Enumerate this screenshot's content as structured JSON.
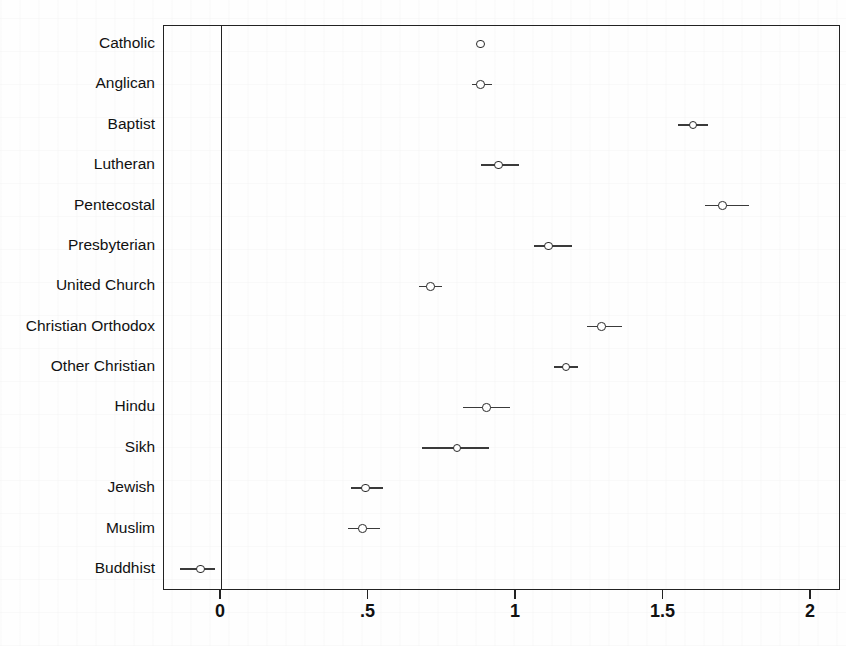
{
  "figure": {
    "kind": "coefficient-plot",
    "background_color": "#fefefe",
    "marker_color": "#2a2a2a",
    "line_color": "#3a3a3a"
  },
  "chart_data": {
    "type": "scatter",
    "title": "",
    "subtitle": "",
    "xlabel": "",
    "ylabel": "",
    "xlim": [
      -0.19,
      2.1
    ],
    "ylim": [
      0,
      14
    ],
    "grid": false,
    "legend": null,
    "reference_line": 0,
    "xticks": [
      0,
      0.5,
      1,
      1.5,
      2
    ],
    "xticklabels": [
      "0",
      ".5",
      "1",
      "1.5",
      "2"
    ],
    "categories": [
      "Catholic",
      "Anglican",
      "Baptist",
      "Lutheran",
      "Pentecostal",
      "Presbyterian",
      "United Church",
      "Christian Orthodox",
      "Other Christian",
      "Hindu",
      "Sikh",
      "Jewish",
      "Muslim",
      "Buddhist"
    ],
    "values": [
      0.88,
      0.88,
      1.6,
      0.94,
      1.7,
      1.11,
      0.71,
      1.29,
      1.17,
      0.9,
      0.8,
      0.49,
      0.48,
      -0.07
    ],
    "ci_low": [
      null,
      0.85,
      1.55,
      0.88,
      1.64,
      1.06,
      0.67,
      1.24,
      1.13,
      0.82,
      0.68,
      0.44,
      0.43,
      -0.14
    ],
    "ci_high": [
      null,
      0.92,
      1.65,
      1.01,
      1.79,
      1.19,
      0.75,
      1.36,
      1.21,
      0.98,
      0.91,
      0.55,
      0.54,
      -0.02
    ],
    "points": [
      {
        "label": "Catholic",
        "value": 0.88,
        "ci_low": null,
        "ci_high": null
      },
      {
        "label": "Anglican",
        "value": 0.88,
        "ci_low": 0.85,
        "ci_high": 0.92
      },
      {
        "label": "Baptist",
        "value": 1.6,
        "ci_low": 1.55,
        "ci_high": 1.65
      },
      {
        "label": "Lutheran",
        "value": 0.94,
        "ci_low": 0.88,
        "ci_high": 1.01
      },
      {
        "label": "Pentecostal",
        "value": 1.7,
        "ci_low": 1.64,
        "ci_high": 1.79
      },
      {
        "label": "Presbyterian",
        "value": 1.11,
        "ci_low": 1.06,
        "ci_high": 1.19
      },
      {
        "label": "United Church",
        "value": 0.71,
        "ci_low": 0.67,
        "ci_high": 0.75
      },
      {
        "label": "Christian Orthodox",
        "value": 1.29,
        "ci_low": 1.24,
        "ci_high": 1.36
      },
      {
        "label": "Other Christian",
        "value": 1.17,
        "ci_low": 1.13,
        "ci_high": 1.21
      },
      {
        "label": "Hindu",
        "value": 0.9,
        "ci_low": 0.82,
        "ci_high": 0.98
      },
      {
        "label": "Sikh",
        "value": 0.8,
        "ci_low": 0.68,
        "ci_high": 0.91
      },
      {
        "label": "Jewish",
        "value": 0.49,
        "ci_low": 0.44,
        "ci_high": 0.55
      },
      {
        "label": "Muslim",
        "value": 0.48,
        "ci_low": 0.43,
        "ci_high": 0.54
      },
      {
        "label": "Buddhist",
        "value": -0.07,
        "ci_low": -0.14,
        "ci_high": -0.02
      }
    ]
  }
}
